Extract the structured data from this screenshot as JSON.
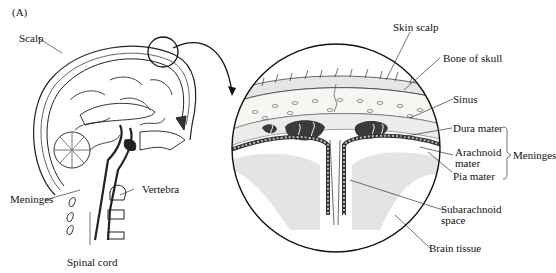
{
  "figure": {
    "panel_label": "(A)",
    "left_labels": {
      "scalp": "Scalp",
      "meninges": "Meninges",
      "vertebra": "Vertebra",
      "spinal_cord": "Spinal cord"
    },
    "detail_labels": {
      "skin_scalp": "Skin scalp",
      "bone_of_skull": "Bone of skull",
      "sinus": "Sinus",
      "dura_mater": "Dura mater",
      "arachnoid_mater_1": "Arachnoid",
      "arachnoid_mater_2": "mater",
      "pia_mater": "Pia mater",
      "subarachnoid_1": "Subarachnoid",
      "subarachnoid_2": "space",
      "brain_tissue": "Brain tissue",
      "meninges_group": "Meninges"
    },
    "colors": {
      "ink": "#1a1a1a",
      "shade": "#555555",
      "light": "#bdbdbd"
    }
  }
}
